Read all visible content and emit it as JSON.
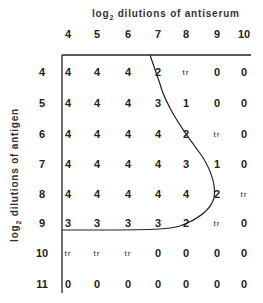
{
  "chart_data": {
    "type": "table",
    "title": "",
    "xlabel": "log2 dilutions of antiserum",
    "ylabel": "log2 dilutions of antigen",
    "columns": [
      "4",
      "5",
      "6",
      "7",
      "8",
      "9",
      "10"
    ],
    "rows": [
      {
        "label": "4",
        "values": [
          "4",
          "4",
          "4",
          "2",
          "tr",
          "0",
          "0"
        ]
      },
      {
        "label": "5",
        "values": [
          "4",
          "4",
          "4",
          "3",
          "1",
          "0",
          "0"
        ]
      },
      {
        "label": "6",
        "values": [
          "4",
          "4",
          "4",
          "4",
          "2",
          "tr",
          "0"
        ]
      },
      {
        "label": "7",
        "values": [
          "4",
          "4",
          "4",
          "4",
          "3",
          "1",
          "0"
        ]
      },
      {
        "label": "8",
        "values": [
          "4",
          "4",
          "4",
          "4",
          "4",
          "2",
          "tr"
        ]
      },
      {
        "label": "9",
        "values": [
          "3",
          "3",
          "3",
          "3",
          "2",
          "tr",
          "0"
        ]
      },
      {
        "label": "10",
        "values": [
          "tr",
          "tr",
          "tr",
          "0",
          "0",
          "0",
          "0"
        ]
      },
      {
        "label": "11",
        "values": [
          "0",
          "0",
          "0",
          "0",
          "0",
          "0",
          "0"
        ]
      }
    ],
    "annotations": [
      "curved boundary line enclosing the strong-reaction region"
    ]
  },
  "labels": {
    "x_title_main": "log",
    "x_title_sub": "2",
    "x_title_rest": " dilutions of antiserum",
    "y_title_main": "log",
    "y_title_sub": "2",
    "y_title_rest": " dilutions of antigen"
  }
}
